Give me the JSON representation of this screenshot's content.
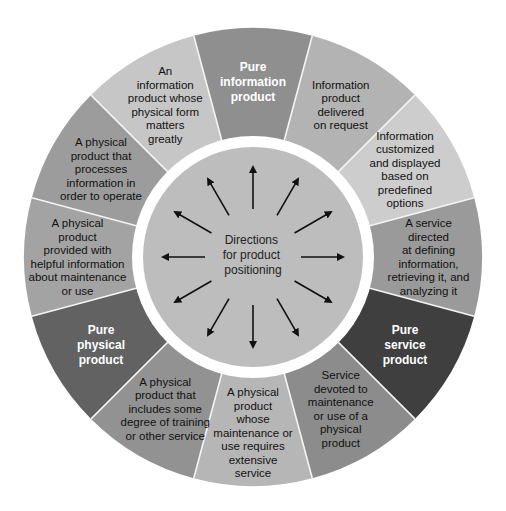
{
  "diagram": {
    "center_label": [
      "Directions",
      "for product",
      "positioning"
    ],
    "arrow_count": 12,
    "colors": {
      "background": "#ffffff",
      "divider": "#f4f4f4",
      "inner_ring": "#ffffff",
      "center_fill": "#bdbdbd",
      "arrow": "#111111"
    },
    "segments": [
      {
        "lines": [
          "Pure",
          "information",
          "product"
        ],
        "pure": true,
        "color": "#8f8f8f"
      },
      {
        "lines": [
          "Information",
          "product",
          "delivered",
          "on request"
        ],
        "pure": false,
        "color": "#b3b3b3"
      },
      {
        "lines": [
          "Information",
          "customized",
          "and displayed",
          "based on",
          "predefined",
          "options"
        ],
        "pure": false,
        "color": "#cdcdcd"
      },
      {
        "lines": [
          "A service",
          "directed",
          "at defining",
          "information,",
          "retrieving it, and",
          "analyzing it"
        ],
        "pure": false,
        "color": "#9a9a9a"
      },
      {
        "lines": [
          "Pure",
          "service",
          "product"
        ],
        "pure": true,
        "color": "#3f3f3f"
      },
      {
        "lines": [
          "Service",
          "devoted to",
          "maintenance",
          "or use of a",
          "physical",
          "product"
        ],
        "pure": false,
        "color": "#8c8c8c"
      },
      {
        "lines": [
          "A physical",
          "product",
          "whose",
          "maintenance or",
          "use requires",
          "extensive",
          "service"
        ],
        "pure": false,
        "color": "#b6b6b6"
      },
      {
        "lines": [
          "A physical",
          "product that",
          "includes some",
          "degree of training",
          "or other service"
        ],
        "pure": false,
        "color": "#929292"
      },
      {
        "lines": [
          "Pure",
          "physical",
          "product"
        ],
        "pure": true,
        "color": "#626262"
      },
      {
        "lines": [
          "A physical",
          "product",
          "provided with",
          "helpful information",
          "about maintenance",
          "or use"
        ],
        "pure": false,
        "color": "#a3a3a3"
      },
      {
        "lines": [
          "A physical",
          "product that",
          "processes",
          "information in",
          "order to operate"
        ],
        "pure": false,
        "color": "#9c9c9c"
      },
      {
        "lines": [
          "An",
          "information",
          "product whose",
          "physical form",
          "matters",
          "greatly"
        ],
        "pure": false,
        "color": "#c6c6c6"
      }
    ]
  }
}
